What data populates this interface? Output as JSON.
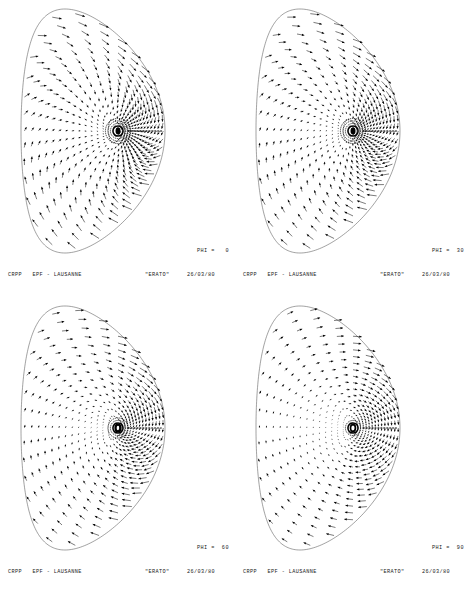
{
  "figure": {
    "type": "vector-field-multi-panel",
    "panel_count": 4,
    "background_color": "#ffffff",
    "ink_color": "#000000",
    "boundary_color": "#555555"
  },
  "panels": [
    {
      "id": "panel-phi-0",
      "phi_label": "PHI =   0",
      "phi_value": "0",
      "footer": {
        "organization": "CRPP   EPF - LAUSANNE",
        "code_name": "\"ERATO\"",
        "date": "26/03/80"
      },
      "field": {
        "swirl": 0.85,
        "center_arrow_angle": 0,
        "center_hub": "filled",
        "hub_rings": 4,
        "arrow_scale": 1.0,
        "rings": 15,
        "spokes": 36
      }
    },
    {
      "id": "panel-phi-30",
      "phi_label": "PHI =  30",
      "phi_value": "30",
      "footer": {
        "organization": "CRPP   EPF - LAUSANNE",
        "code_name": "\"ERATO\"",
        "date": "26/03/80"
      },
      "field": {
        "swirl": 0.62,
        "center_arrow_angle": 0,
        "center_hub": "filled",
        "hub_rings": 4,
        "arrow_scale": 0.95,
        "rings": 15,
        "spokes": 36
      }
    },
    {
      "id": "panel-phi-60",
      "phi_label": "PHI =  60",
      "phi_value": "60",
      "footer": {
        "organization": "CRPP   EPF - LAUSANNE",
        "code_name": "\"ERATO\"",
        "date": "26/03/80"
      },
      "field": {
        "swirl": 0.38,
        "center_arrow_angle": 0,
        "center_hub": "ring",
        "hub_rings": 3,
        "arrow_scale": 0.9,
        "rings": 15,
        "spokes": 36
      }
    },
    {
      "id": "panel-phi-90",
      "phi_label": "PHI =  90",
      "phi_value": "90",
      "footer": {
        "organization": "CRPP   EPF - LAUSANNE",
        "code_name": "\"ERATO\"",
        "date": "26/03/80"
      },
      "field": {
        "swirl": 0.12,
        "center_arrow_angle": 0,
        "center_hub": "hollow",
        "hub_rings": 2,
        "arrow_scale": 0.82,
        "rings": 15,
        "spokes": 36
      }
    }
  ],
  "chart_data": {
    "type": "scatter",
    "title": "",
    "xlabel": "",
    "ylabel": "",
    "series": [
      {
        "name": "PHI = 0",
        "swirl": 0.85,
        "hub": "filled"
      },
      {
        "name": "PHI = 30",
        "swirl": 0.62,
        "hub": "filled"
      },
      {
        "name": "PHI = 60",
        "swirl": 0.38,
        "hub": "ring"
      },
      {
        "name": "PHI = 90",
        "swirl": 0.12,
        "hub": "hollow"
      }
    ],
    "legend_position": "none",
    "grid": false
  }
}
